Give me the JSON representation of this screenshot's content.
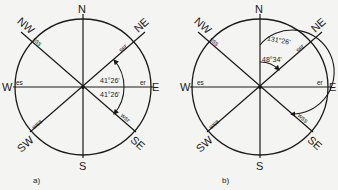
{
  "figures": [
    {
      "id": "a",
      "caption": "a)",
      "center": [
        83,
        87
      ],
      "radius": 68,
      "cardinals": {
        "N": "N",
        "E": "E",
        "S": "S",
        "W": "W",
        "NE": "NE",
        "NW": "NW",
        "SE": "SE",
        "SW": "SW"
      },
      "tick_labels": {
        "ne": "ssr",
        "nw": "sss",
        "se": "wsr",
        "sw": "wss",
        "e": "er",
        "w": "es"
      },
      "angles": [
        {
          "label": "41°26'",
          "from": "E",
          "to": "ssr",
          "direction": "counter-clockwise"
        },
        {
          "label": "41°26'",
          "from": "E",
          "to": "wsr",
          "direction": "clockwise"
        }
      ]
    },
    {
      "id": "b",
      "caption": "b)",
      "center": [
        260,
        87
      ],
      "radius": 68,
      "cardinals": {
        "N": "N",
        "E": "E",
        "S": "S",
        "W": "W",
        "NE": "NE",
        "NW": "NW",
        "SE": "SE",
        "SW": "SW"
      },
      "tick_labels": {
        "ne": "ssr",
        "nw": "sss",
        "se": "wss",
        "sw": "wss",
        "e": "er",
        "w": "es"
      },
      "angles": [
        {
          "label": "131°26'",
          "from": "N",
          "to": "wss",
          "direction": "clockwise"
        },
        {
          "label": "48°34'",
          "from": "N",
          "to": "ssr",
          "direction": "clockwise"
        }
      ]
    }
  ],
  "colors": {
    "ink": "#1a1a1a",
    "paper": "#f4f4f2"
  }
}
